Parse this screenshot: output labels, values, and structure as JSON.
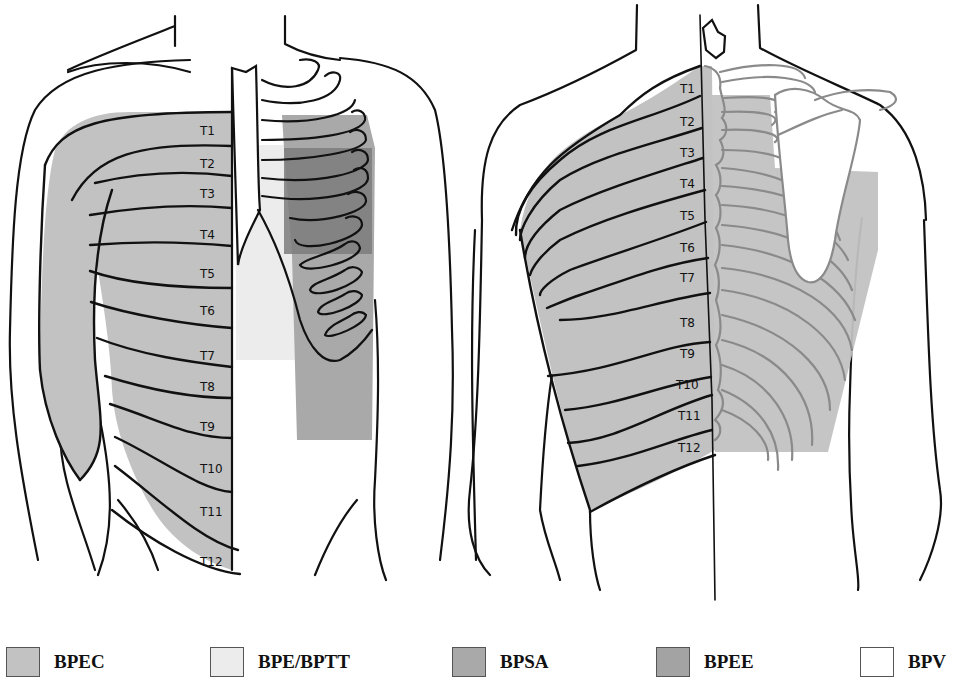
{
  "figure": {
    "front_view": {
      "dermatome_labels": [
        "T1",
        "T2",
        "T3",
        "T4",
        "T5",
        "T6",
        "T7",
        "T8",
        "T9",
        "T10",
        "T11",
        "T12"
      ]
    },
    "back_view": {
      "dermatome_labels": [
        "T1",
        "T2",
        "T3",
        "T4",
        "T5",
        "T6",
        "T7",
        "T8",
        "T9",
        "T10",
        "T11",
        "T12"
      ]
    }
  },
  "legend": {
    "items": [
      {
        "label": "BPEC",
        "color": "#c2c2c2"
      },
      {
        "label": "BPE/BPTT",
        "color": "#ececec"
      },
      {
        "label": "BPSA",
        "color": "#a9a9a9"
      },
      {
        "label": "BPEE",
        "color": "#a3a3a3"
      },
      {
        "label": "BPV",
        "color": "#ffffff"
      }
    ]
  },
  "colors": {
    "bpec": "#c2c2c2",
    "bpe_bptt": "#ececec",
    "bpsa": "#a9a9a9",
    "bpee": "#a3a3a3",
    "overlap_dark": "#7d7d7d",
    "outline": "#111111",
    "back_bone": "#8a8a8a"
  }
}
